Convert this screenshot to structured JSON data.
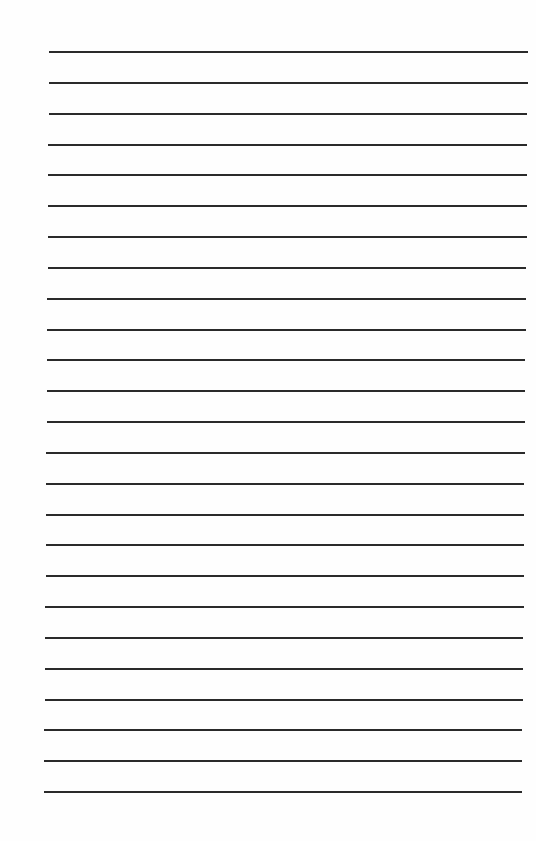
{
  "page": {
    "type": "lined-paper",
    "background": "#fefefe",
    "line_color": "#2a2a2a",
    "line_count": 25,
    "first_line_y": 51,
    "last_line_y": 791,
    "text": ""
  }
}
